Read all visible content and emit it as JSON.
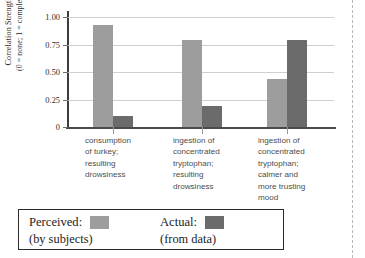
{
  "chart_data": {
    "type": "bar",
    "title": "",
    "subtitle": "",
    "xlabel": "",
    "ylabel": "Correlation Strength",
    "ylabel_note": "(0 = none; 1 = complete)",
    "ylim": [
      0,
      1.0
    ],
    "yticks": [
      0,
      0.25,
      0.5,
      0.75,
      1.0
    ],
    "ytick_labels": [
      "0",
      "0.25",
      "0.50",
      "0.75",
      "1.00"
    ],
    "grid": true,
    "legend_position": "bottom",
    "categories": [
      "consumption\nof turkey;\nresulting\ndrowsiness",
      "ingestion of\nconcentrated\ntryptophan;\nresulting\ndrowsiness",
      "ingestion of\nconcentrated\ntryptophan;\ncalmer and\nmore trusting\nmood"
    ],
    "series": [
      {
        "name": "Perceived",
        "note": "(by subjects)",
        "color": "#9d9d9d",
        "values": [
          0.93,
          0.79,
          0.44
        ]
      },
      {
        "name": "Actual",
        "note": "(from data)",
        "color": "#6b6b6b",
        "values": [
          0.1,
          0.19,
          0.79
        ]
      }
    ]
  },
  "legend": {
    "perceived_label": "Perceived:",
    "perceived_sub": "(by subjects)",
    "actual_label": "Actual:",
    "actual_sub": "(from data)"
  },
  "colors": {
    "perceived": "#9d9d9d",
    "actual": "#6b6b6b",
    "axis": "#3c3c3c",
    "gridline": "#cfcfcf",
    "legend_border": "#2b2b2b"
  }
}
